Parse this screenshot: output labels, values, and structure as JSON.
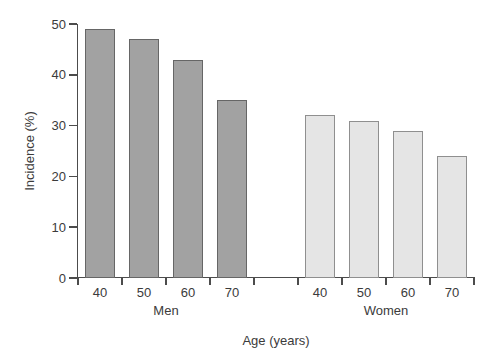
{
  "figure": {
    "background": "#ffffff",
    "text_color": "#3b3b3b",
    "axis_color": "#4c4c4c"
  },
  "chart_data": {
    "type": "bar",
    "title": "",
    "xlabel": "Age (years)",
    "ylabel": "Incidence (%)",
    "categories": [
      "40",
      "50",
      "60",
      "70"
    ],
    "series": [
      {
        "name": "Men",
        "values": [
          49,
          47,
          43,
          35
        ],
        "fill": "#a2a2a2",
        "stroke": "#666666"
      },
      {
        "name": "Women",
        "values": [
          32,
          31,
          29,
          24
        ],
        "fill": "#e5e5e5",
        "stroke": "#8f8f8f"
      }
    ],
    "ylim": [
      0,
      50
    ],
    "yticks": [
      0,
      10,
      20,
      30,
      40,
      50
    ],
    "grid": false,
    "legend": "none",
    "layout": {
      "gap_slots_between_groups": 1
    }
  }
}
